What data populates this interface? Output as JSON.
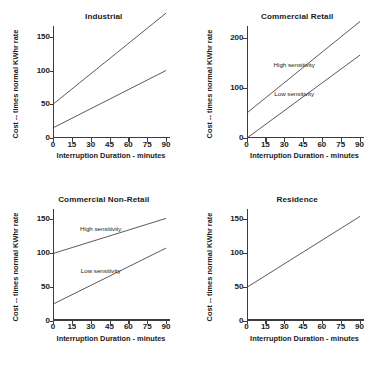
{
  "figure": {
    "background": "#ffffff",
    "ink": "#1a1a1a",
    "line_color": "#3c3c3c",
    "layout": "2x2 grid of line charts"
  },
  "common": {
    "xlabel": "Interruption Duration - minutes",
    "ylabel": "Cost -- times normal KWhr rate",
    "xticks": [
      0,
      15,
      30,
      45,
      60,
      75,
      90
    ],
    "xlim": [
      0,
      90
    ],
    "high_label": "High sensitivity",
    "low_label": "Low sensitivity"
  },
  "chart_data": [
    {
      "type": "line",
      "title": "Industrial",
      "xlabel": "Interruption Duration - minutes",
      "ylabel": "Cost -- times normal KWhr rate",
      "x": [
        0,
        90
      ],
      "xlim": [
        0,
        90
      ],
      "ylim": [
        0,
        160
      ],
      "xticks": [
        0,
        15,
        30,
        45,
        60,
        75,
        90
      ],
      "yticks": [
        0,
        50,
        100,
        150
      ],
      "grid": false,
      "legend": "none",
      "series": [
        {
          "name": "High sensitivity",
          "values": [
            50,
            185
          ],
          "label_shown": false
        },
        {
          "name": "Low sensitivity",
          "values": [
            15,
            100
          ],
          "label_shown": false
        }
      ]
    },
    {
      "type": "line",
      "title": "Commercial Retail",
      "xlabel": "Interruption Duration - minutes",
      "ylabel": "Cost -- times normal KWhr rate",
      "x": [
        0,
        90
      ],
      "xlim": [
        0,
        90
      ],
      "ylim": [
        0,
        215
      ],
      "xticks": [
        0,
        15,
        30,
        45,
        60,
        75,
        90
      ],
      "yticks": [
        0,
        100,
        200
      ],
      "grid": false,
      "legend": "inline-annotations",
      "series": [
        {
          "name": "High sensitivity",
          "values": [
            50,
            232
          ],
          "label_shown": true
        },
        {
          "name": "Low sensitivity",
          "values": [
            0,
            165
          ],
          "label_shown": true
        }
      ]
    },
    {
      "type": "line",
      "title": "Commercial Non-Retail",
      "xlabel": "Interruption Duration - minutes",
      "ylabel": "Cost -- times normal KWhr rate",
      "x": [
        0,
        90
      ],
      "xlim": [
        0,
        90
      ],
      "ylim": [
        0,
        160
      ],
      "xticks": [
        0,
        15,
        30,
        45,
        60,
        75,
        90
      ],
      "yticks": [
        0,
        50,
        100,
        150
      ],
      "grid": false,
      "legend": "inline-annotations",
      "series": [
        {
          "name": "High sensitivity",
          "values": [
            100,
            152
          ],
          "label_shown": true
        },
        {
          "name": "Low sensitivity",
          "values": [
            25,
            108
          ],
          "label_shown": true
        }
      ]
    },
    {
      "type": "line",
      "title": "Residence",
      "xlabel": "Interruption Duration - minutes",
      "ylabel": "Cost -- times normal KWhr rate",
      "x": [
        0,
        90
      ],
      "xlim": [
        0,
        90
      ],
      "ylim": [
        0,
        160
      ],
      "xticks": [
        0,
        15,
        30,
        45,
        60,
        75,
        90
      ],
      "yticks": [
        0,
        50,
        100,
        150
      ],
      "grid": false,
      "legend": "none",
      "series": [
        {
          "name": "Residence",
          "values": [
            50,
            155
          ],
          "label_shown": false
        }
      ]
    }
  ]
}
